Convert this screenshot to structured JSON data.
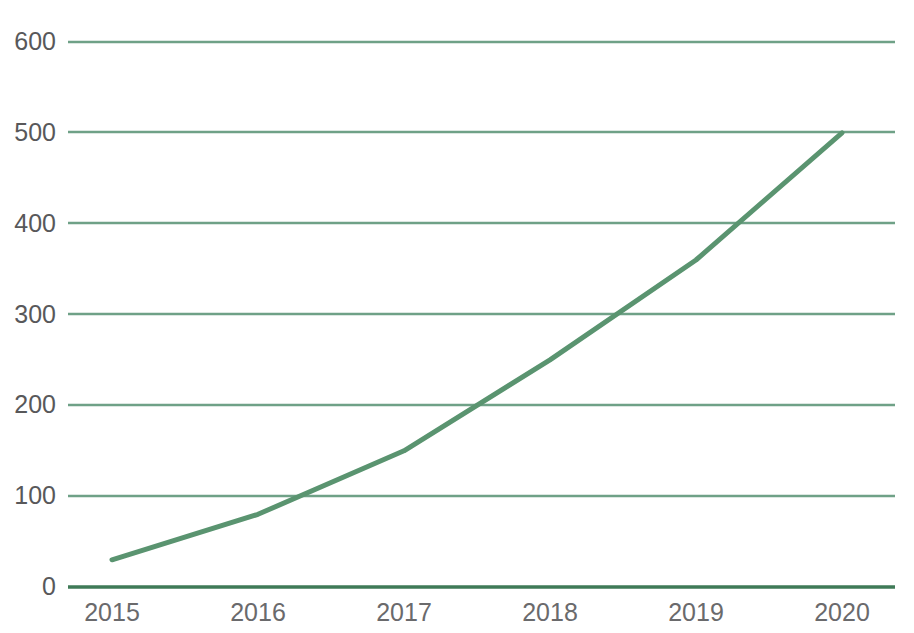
{
  "chart_data": {
    "type": "line",
    "title": "",
    "subtitle": "",
    "xlabel": "",
    "ylabel": "",
    "categories": [
      "2015",
      "2016",
      "2017",
      "2018",
      "2019",
      "2020"
    ],
    "x": [
      2015,
      2016,
      2017,
      2018,
      2019,
      2020
    ],
    "values": [
      30,
      80,
      150,
      250,
      360,
      500
    ],
    "series": [
      {
        "name": "",
        "values": [
          30,
          80,
          150,
          250,
          360,
          500
        ]
      }
    ],
    "ylim": [
      0,
      600
    ],
    "y_ticks": [
      0,
      100,
      200,
      300,
      400,
      500,
      600
    ],
    "y_tick_labels": [
      "0",
      "100",
      "200",
      "300",
      "400",
      "500",
      "600"
    ],
    "x_tick_labels": [
      "2015",
      "2016",
      "2017",
      "2018",
      "2019",
      "2020"
    ],
    "grid": true,
    "grid_axis": "y",
    "legend": false,
    "legend_position": "none",
    "annotations": []
  },
  "style": {
    "line_color": "#5a9470",
    "grid_color": "#6fa187",
    "axis_line_color": "#3f7a57",
    "tick_label_color": "#58585a",
    "background_color": "#ffffff",
    "line_width": 5
  }
}
